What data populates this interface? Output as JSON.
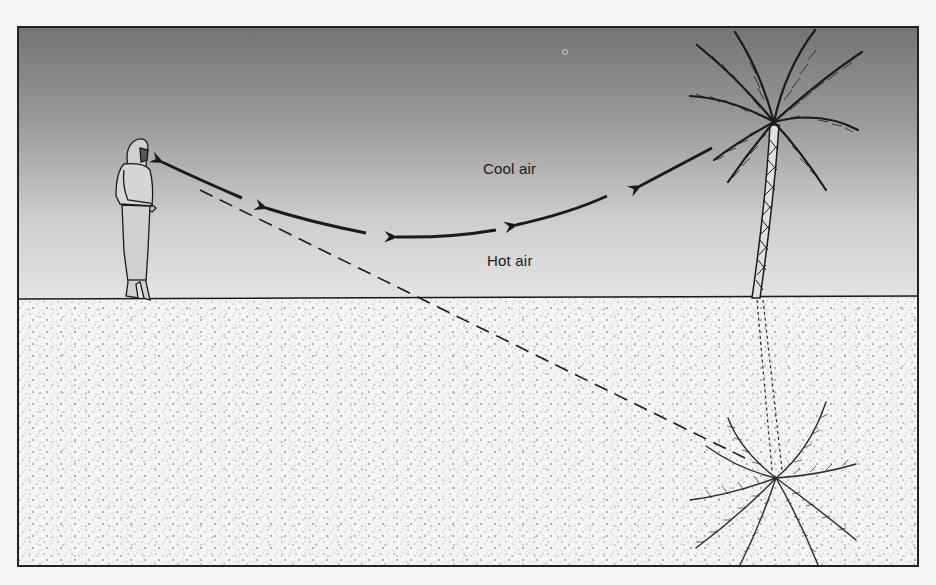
{
  "diagram": {
    "labels": {
      "cool_air": "Cool air",
      "hot_air": "Hot air"
    },
    "elements": {
      "observer": "person-standing",
      "object": "palm-tree",
      "mirage": "inverted-palm-tree-image",
      "light_path": "curved-arrows",
      "apparent_line_of_sight": "dashed-line"
    },
    "colors": {
      "sky_top": "#7c7c7c",
      "sky_bottom": "#e2e2e2",
      "sand": "#f3f3f1",
      "ink": "#1a1a1a",
      "page": "#f6f6f4"
    }
  }
}
